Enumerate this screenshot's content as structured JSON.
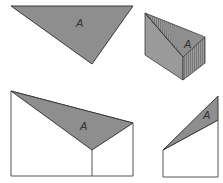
{
  "diagram": {
    "colors": {
      "face_fill": "#8e8e8e",
      "face_fill_light": "#a6a6a6",
      "side_fill": "#9a9a9a",
      "hatch": "#6e6e6e",
      "stroke": "#3a3a3a",
      "outline": "#555555",
      "background": "#ffffff"
    },
    "figures": [
      {
        "id": "flat-triangle",
        "label": "A"
      },
      {
        "id": "prism",
        "label": "A"
      },
      {
        "id": "front-elevation",
        "label": "A"
      },
      {
        "id": "side-elevation",
        "label": "A"
      }
    ]
  }
}
